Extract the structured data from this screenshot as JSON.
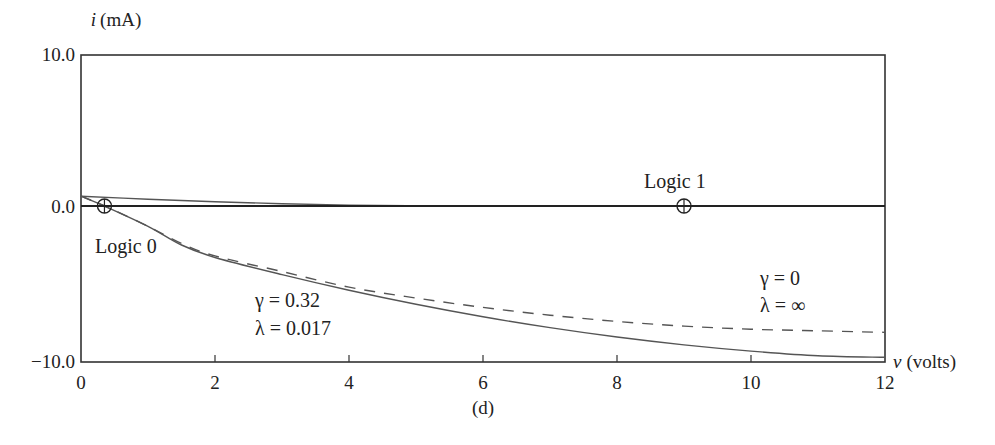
{
  "chart_data": {
    "type": "line",
    "title": "",
    "caption": "(d)",
    "xlabel": "v (volts)",
    "xlabel_var": "v",
    "xlabel_unit": "(volts)",
    "ylabel": "i (mA)",
    "ylabel_var": "i",
    "ylabel_unit": "(mA)",
    "xlim": [
      0,
      12
    ],
    "ylim": [
      -10,
      10
    ],
    "x_ticks": [
      0,
      2,
      4,
      6,
      8,
      10,
      12
    ],
    "x_tick_labels": [
      "0",
      "2",
      "4",
      "6",
      "8",
      "10",
      "12"
    ],
    "y_ticks": [
      10,
      0,
      -10
    ],
    "y_tick_labels": [
      "10.0",
      "0.0",
      "−10.0"
    ],
    "grid": false,
    "legend": null,
    "series": [
      {
        "name": "γ = 0.32, λ = 0.017",
        "style": "solid",
        "color": "#555555",
        "x": [
          0,
          0.35,
          1,
          1.5,
          2,
          3,
          4,
          5,
          6,
          7,
          8,
          9,
          10,
          11,
          12
        ],
        "y": [
          0.65,
          0,
          -1.3,
          -2.5,
          -3.3,
          -4.4,
          -5.4,
          -6.3,
          -7.1,
          -7.8,
          -8.4,
          -8.9,
          -9.3,
          -9.6,
          -9.7
        ]
      },
      {
        "name": "γ = 0, λ = ∞",
        "style": "dashed",
        "color": "#555555",
        "x": [
          0,
          0.35,
          1,
          1.5,
          2,
          3,
          4,
          5,
          6,
          7,
          8,
          9,
          10,
          11,
          12
        ],
        "y": [
          0.65,
          0,
          -1.3,
          -2.4,
          -3.2,
          -4.2,
          -5.2,
          -5.9,
          -6.5,
          -7.0,
          -7.4,
          -7.7,
          -7.9,
          -8.0,
          -8.1
        ]
      },
      {
        "name": "upper load curve",
        "style": "solid",
        "color": "#555555",
        "x": [
          0,
          1,
          2,
          3,
          4,
          5,
          6,
          12
        ],
        "y": [
          0.65,
          0.45,
          0.28,
          0.15,
          0.06,
          0.02,
          0,
          0
        ]
      },
      {
        "name": "zero line",
        "style": "solid",
        "color": "#222222",
        "x": [
          0,
          12
        ],
        "y": [
          0,
          0
        ]
      }
    ],
    "points": [
      {
        "name": "Logic 0",
        "x": 0.35,
        "y": 0,
        "marker": "circle-plus"
      },
      {
        "name": "Logic 1",
        "x": 9.0,
        "y": 0,
        "marker": "circle-plus"
      }
    ],
    "annotations": [
      {
        "text": "Logic 0",
        "x": 0.35,
        "y": -2.4
      },
      {
        "text": "Logic 1",
        "x": 8.3,
        "y": 1.2
      },
      {
        "text": "γ = 0.32",
        "x": 2.5,
        "y": -5.8
      },
      {
        "text": "λ = 0.017",
        "x": 2.5,
        "y": -8.0
      },
      {
        "text": "γ = 0",
        "x": 10.2,
        "y": -4.5
      },
      {
        "text": "λ = ∞",
        "x": 10.2,
        "y": -6.6
      }
    ]
  },
  "labels": {
    "y_axis_var": "i",
    "y_axis_unit": "(mA)",
    "x_axis_var": "v",
    "x_axis_unit": "(volts)",
    "caption": "(d)",
    "logic0": "Logic 0",
    "logic1": "Logic 1",
    "gamma1": "γ = 0.32",
    "lambda1": "λ = 0.017",
    "gamma2": "γ = 0",
    "lambda2": "λ = ∞"
  }
}
